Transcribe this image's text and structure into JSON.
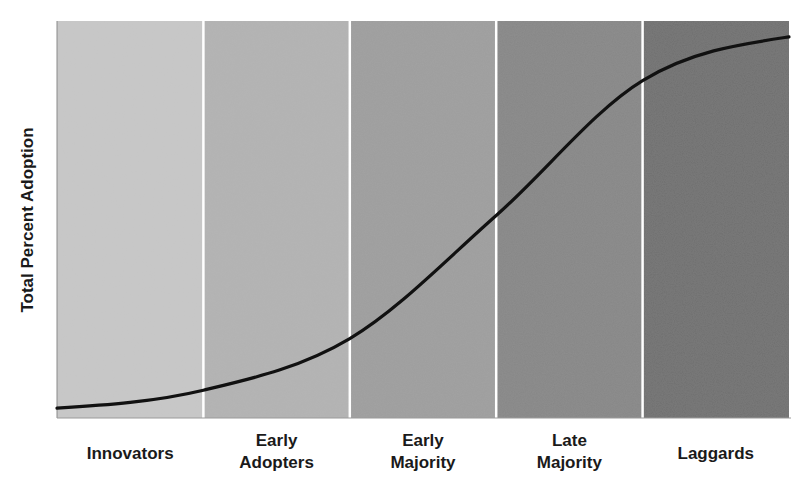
{
  "chart_data": {
    "type": "line",
    "title": "",
    "xlabel": "",
    "ylabel": "Total Percent Adoption",
    "categories": [
      "Innovators",
      "Early Adopters",
      "Early Majority",
      "Late Majority",
      "Laggards"
    ],
    "category_labels": [
      [
        "Innovators"
      ],
      [
        "Early",
        "Adopters"
      ],
      [
        "Early",
        "Majority"
      ],
      [
        "Late",
        "Majority"
      ],
      [
        "Laggards"
      ]
    ],
    "band_colors": [
      "#c8c8c8",
      "#b3b3b3",
      "#9f9f9f",
      "#878787",
      "#707070"
    ],
    "series": [
      {
        "name": "Adoption S-curve",
        "color": "#111111",
        "x": [
          0,
          1,
          2,
          3,
          4,
          5
        ],
        "values": [
          2.5,
          7,
          20,
          51,
          85,
          96
        ]
      }
    ],
    "xlim": [
      0,
      5
    ],
    "ylim": [
      0,
      100
    ],
    "grid": false,
    "legend": "none",
    "y_ticks": false,
    "x_ticks": false
  }
}
